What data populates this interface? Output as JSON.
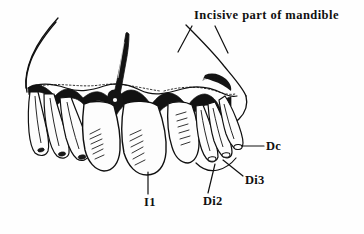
{
  "figure": {
    "kind": "anatomical-line-drawing",
    "background_color": "#fefefe",
    "ink_color": "#101010",
    "width": 364,
    "height": 234
  },
  "labels": {
    "title": "Incisive part of mandible",
    "dc": "Dc",
    "di3": "Di3",
    "di2": "Di2",
    "i1": "I1"
  },
  "annotations": [
    {
      "id": "title",
      "text": "Incisive part of mandible",
      "x": 194,
      "y": 9,
      "leader_lines": 2,
      "points_to": "incisive part of the mandibular bone body"
    },
    {
      "id": "dc",
      "text": "Dc",
      "x": 266,
      "y": 140,
      "leader_lines": 1,
      "points_to": "deciduous canine tooth, rightmost"
    },
    {
      "id": "di3",
      "text": "Di3",
      "x": 245,
      "y": 174,
      "leader_lines": 1,
      "points_to": "third deciduous incisor"
    },
    {
      "id": "di2",
      "text": "Di2",
      "x": 203,
      "y": 195,
      "leader_lines": 1,
      "points_to": "second deciduous incisor"
    },
    {
      "id": "i1",
      "text": "I1",
      "x": 144,
      "y": 196,
      "leader_lines": 1,
      "points_to": "first permanent incisor, large central tooth"
    }
  ]
}
